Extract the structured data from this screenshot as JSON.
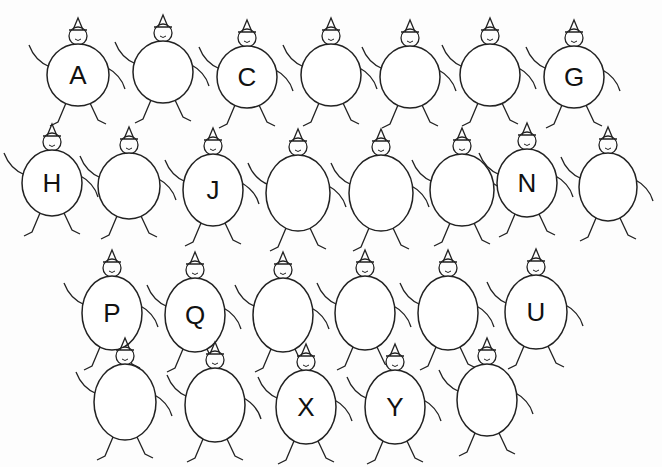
{
  "worksheet": {
    "title": "Alphabet fill-in",
    "rows": [
      {
        "figures": [
          {
            "letter": "A",
            "cx": 78,
            "cy": 75,
            "rx": 31,
            "ry": 31
          },
          {
            "letter": "",
            "cx": 163,
            "cy": 72,
            "rx": 30,
            "ry": 31
          },
          {
            "letter": "C",
            "cx": 247,
            "cy": 77,
            "rx": 30,
            "ry": 31
          },
          {
            "letter": "",
            "cx": 331,
            "cy": 75,
            "rx": 30,
            "ry": 31
          },
          {
            "letter": "",
            "cx": 410,
            "cy": 77,
            "rx": 30,
            "ry": 31
          },
          {
            "letter": "",
            "cx": 490,
            "cy": 75,
            "rx": 30,
            "ry": 31
          },
          {
            "letter": "G",
            "cx": 574,
            "cy": 77,
            "rx": 30,
            "ry": 31
          }
        ]
      },
      {
        "figures": [
          {
            "letter": "H",
            "cx": 52,
            "cy": 183,
            "rx": 30,
            "ry": 33
          },
          {
            "letter": "",
            "cx": 129,
            "cy": 186,
            "rx": 31,
            "ry": 33
          },
          {
            "letter": "J",
            "cx": 213,
            "cy": 190,
            "rx": 30,
            "ry": 36
          },
          {
            "letter": "",
            "cx": 298,
            "cy": 193,
            "rx": 32,
            "ry": 38
          },
          {
            "letter": "",
            "cx": 381,
            "cy": 193,
            "rx": 32,
            "ry": 38
          },
          {
            "letter": "",
            "cx": 462,
            "cy": 190,
            "rx": 32,
            "ry": 36
          },
          {
            "letter": "N",
            "cx": 527,
            "cy": 183,
            "rx": 30,
            "ry": 34
          },
          {
            "letter": "",
            "cx": 608,
            "cy": 187,
            "rx": 29,
            "ry": 34
          }
        ]
      },
      {
        "figures": [
          {
            "letter": "P",
            "cx": 112,
            "cy": 313,
            "rx": 30,
            "ry": 37
          },
          {
            "letter": "Q",
            "cx": 195,
            "cy": 315,
            "rx": 30,
            "ry": 37
          },
          {
            "letter": "",
            "cx": 283,
            "cy": 315,
            "rx": 30,
            "ry": 37
          },
          {
            "letter": "",
            "cx": 365,
            "cy": 313,
            "rx": 30,
            "ry": 37
          },
          {
            "letter": "",
            "cx": 448,
            "cy": 313,
            "rx": 30,
            "ry": 37
          },
          {
            "letter": "U",
            "cx": 536,
            "cy": 312,
            "rx": 31,
            "ry": 37
          }
        ]
      },
      {
        "figures": [
          {
            "letter": "",
            "cx": 125,
            "cy": 402,
            "rx": 31,
            "ry": 38
          },
          {
            "letter": "",
            "cx": 215,
            "cy": 405,
            "rx": 30,
            "ry": 37
          },
          {
            "letter": "X",
            "cx": 306,
            "cy": 407,
            "rx": 30,
            "ry": 37
          },
          {
            "letter": "Y",
            "cx": 395,
            "cy": 407,
            "rx": 30,
            "ry": 37
          },
          {
            "letter": "",
            "cx": 487,
            "cy": 400,
            "rx": 30,
            "ry": 36
          }
        ]
      }
    ]
  }
}
